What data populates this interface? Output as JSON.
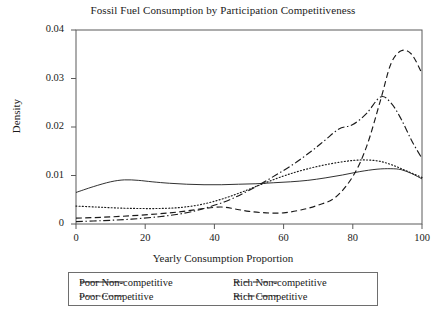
{
  "chart_data": {
    "type": "line",
    "title": "Fossil Fuel Consumption by Participation Competitiveness",
    "xlabel": "Yearly Consumption Proportion",
    "ylabel": "Density",
    "xlim": [
      0,
      100
    ],
    "ylim": [
      0,
      0.04
    ],
    "xticks": [
      "0",
      "20",
      "40",
      "60",
      "80",
      "100"
    ],
    "yticks": [
      "0",
      "0.01",
      "0.02",
      "0.03",
      "0.04"
    ],
    "grid": false,
    "legend_position": "below-axes",
    "series": [
      {
        "name": "Poor Non-competitive",
        "style": "solid",
        "color": "#1a1a1a",
        "x": [
          0,
          5,
          10,
          14,
          18,
          22,
          27,
          32,
          37,
          42,
          47,
          52,
          57,
          62,
          67,
          72,
          77,
          82,
          87,
          91,
          94,
          97,
          100
        ],
        "values": [
          0.0065,
          0.0077,
          0.0087,
          0.0091,
          0.009,
          0.0087,
          0.0084,
          0.0082,
          0.0081,
          0.0081,
          0.0082,
          0.0083,
          0.0085,
          0.0087,
          0.009,
          0.0095,
          0.0101,
          0.0108,
          0.0113,
          0.0114,
          0.0112,
          0.0104,
          0.0093
        ]
      },
      {
        "name": "Poor Competitive",
        "style": "dotted",
        "color": "#1a1a1a",
        "x": [
          0,
          6,
          12,
          18,
          24,
          30,
          36,
          42,
          48,
          54,
          60,
          65,
          70,
          75,
          80,
          84,
          88,
          92,
          96,
          100
        ],
        "values": [
          0.0037,
          0.0035,
          0.0033,
          0.0032,
          0.0032,
          0.0034,
          0.004,
          0.0051,
          0.0066,
          0.0083,
          0.0099,
          0.011,
          0.0119,
          0.0126,
          0.0131,
          0.0132,
          0.0129,
          0.012,
          0.0108,
          0.0096
        ]
      },
      {
        "name": "Rich Non-competitive",
        "style": "dashed",
        "color": "#1a1a1a",
        "x": [
          0,
          8,
          16,
          24,
          31,
          37,
          42,
          46,
          50,
          55,
          60,
          65,
          70,
          75,
          80,
          84,
          88,
          91,
          94,
          97,
          100
        ],
        "values": [
          0.0012,
          0.0014,
          0.0017,
          0.0021,
          0.0026,
          0.0032,
          0.0035,
          0.0031,
          0.0026,
          0.0023,
          0.0023,
          0.0029,
          0.0039,
          0.0055,
          0.0098,
          0.016,
          0.0255,
          0.033,
          0.0357,
          0.035,
          0.031
        ]
      },
      {
        "name": "Rich Competitive",
        "style": "dashdot",
        "color": "#1a1a1a",
        "x": [
          0,
          8,
          16,
          24,
          31,
          37,
          43,
          48,
          53,
          58,
          63,
          68,
          72,
          76,
          80,
          84,
          88,
          91,
          94,
          97,
          100
        ],
        "values": [
          0.0005,
          0.0007,
          0.001,
          0.0015,
          0.0022,
          0.0032,
          0.0046,
          0.0062,
          0.0081,
          0.0102,
          0.0124,
          0.015,
          0.0173,
          0.0196,
          0.0205,
          0.0228,
          0.0262,
          0.025,
          0.0216,
          0.0172,
          0.0135
        ]
      }
    ]
  },
  "legend": {
    "entries": [
      {
        "label": "Poor Non-competitive",
        "style": "solid"
      },
      {
        "label": "Poor Competitive",
        "style": "dotted"
      },
      {
        "label": "Rich Non-competitive",
        "style": "dashed"
      },
      {
        "label": "Rich Competitive",
        "style": "dashdot"
      }
    ]
  }
}
